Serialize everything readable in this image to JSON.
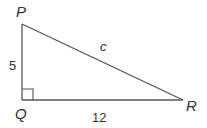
{
  "diagram": {
    "type": "right-triangle",
    "colors": {
      "line": "#555555",
      "text": "#333333",
      "background": "#ffffff"
    },
    "vertices": {
      "P": {
        "label": "P",
        "x": 22,
        "y": 24
      },
      "Q": {
        "label": "Q",
        "x": 22,
        "y": 100
      },
      "R": {
        "label": "R",
        "x": 183,
        "y": 100
      }
    },
    "right_angle_at": "Q",
    "sides": {
      "PQ": {
        "label": "5"
      },
      "QR": {
        "label": "12"
      },
      "PR": {
        "label": "c"
      }
    }
  }
}
